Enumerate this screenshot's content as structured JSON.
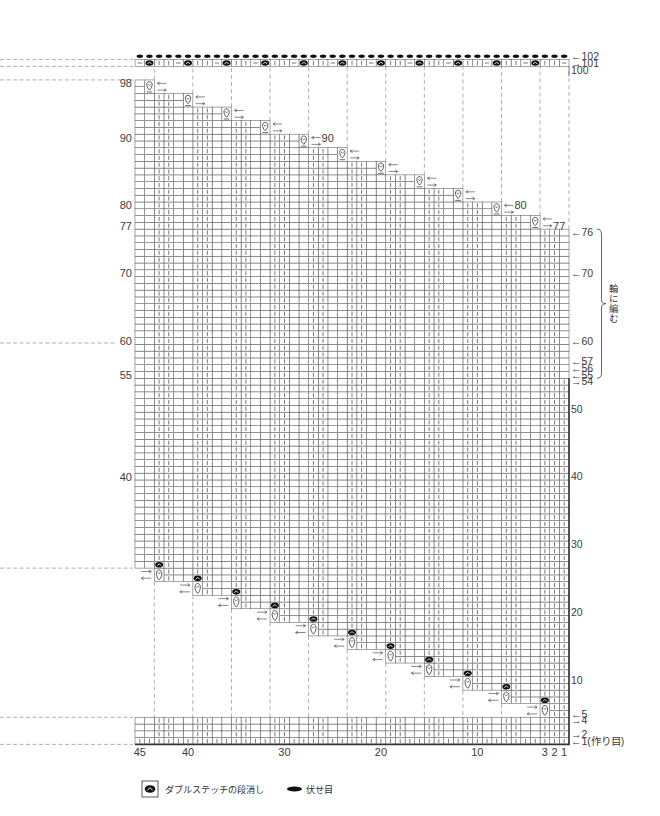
{
  "chart": {
    "total_stitches": 45,
    "total_rows": 102,
    "step_stitches": 4,
    "step_rows": 2,
    "full_rows_bottom": 4,
    "short_rows_bottom_first_row": 5,
    "short_rows_top_last_row": 76,
    "closing_row": 101,
    "bind_off_row": 102,
    "flat_edge_until_row": 54,
    "knit_columns_mod4": [
      2,
      3
    ],
    "closing_row_repeat": [
      "double-stitch-close",
      "purl",
      "knit",
      "knit"
    ]
  },
  "column_labels": [
    {
      "col": 45,
      "text": "45"
    },
    {
      "col": 40,
      "text": "40"
    },
    {
      "col": 30,
      "text": "30"
    },
    {
      "col": 20,
      "text": "20"
    },
    {
      "col": 10,
      "text": "10"
    },
    {
      "col": 3,
      "text": "3"
    },
    {
      "col": 2,
      "text": "2"
    },
    {
      "col": 1,
      "text": "1"
    }
  ],
  "left_row_labels": [
    {
      "row": 98,
      "text": "98"
    },
    {
      "row": 90,
      "text": "90"
    },
    {
      "row": 80,
      "text": "80"
    },
    {
      "row": 77,
      "text": "77"
    },
    {
      "row": 70,
      "text": "70"
    },
    {
      "row": 60,
      "text": "60"
    },
    {
      "row": 55,
      "text": "55"
    },
    {
      "row": 40,
      "text": "40"
    }
  ],
  "right_row_labels": [
    {
      "row": 102,
      "arrow": "←",
      "text": "102"
    },
    {
      "row": 101,
      "arrow": "→",
      "text": "101"
    },
    {
      "row": 100,
      "arrow": "",
      "text": "100"
    },
    {
      "row": 76,
      "arrow": "←",
      "text": "76"
    },
    {
      "row": 70,
      "arrow": "←",
      "text": "70"
    },
    {
      "row": 60,
      "arrow": "←",
      "text": "60"
    },
    {
      "row": 57,
      "arrow": "←",
      "text": "57"
    },
    {
      "row": 56,
      "arrow": "←",
      "text": "56"
    },
    {
      "row": 55,
      "arrow": "←",
      "text": "55"
    },
    {
      "row": 54,
      "arrow": "→",
      "text": "54"
    },
    {
      "row": 50,
      "arrow": "",
      "text": "50"
    },
    {
      "row": 40,
      "arrow": "",
      "text": "40"
    },
    {
      "row": 30,
      "arrow": "",
      "text": "30"
    },
    {
      "row": 20,
      "arrow": "",
      "text": "20"
    },
    {
      "row": 10,
      "arrow": "",
      "text": "10"
    },
    {
      "row": 5,
      "arrow": "←",
      "text": "5"
    },
    {
      "row": 4,
      "arrow": "→",
      "text": "4"
    },
    {
      "row": 2,
      "arrow": "→",
      "text": "2"
    },
    {
      "row": 1,
      "arrow": "←",
      "text": "1(作り目)"
    }
  ],
  "inner_row_labels": [
    {
      "row": 77,
      "text": "77"
    },
    {
      "row": 80,
      "text": "80"
    },
    {
      "row": 90,
      "text": "90"
    }
  ],
  "round_section": {
    "label": "輪に編む",
    "from_row": 55,
    "to_row": 76
  },
  "legend": [
    {
      "icon": "double-stitch-close-icon",
      "label": "ダブルステッチの段消し"
    },
    {
      "icon": "bind-off-icon",
      "label": "伏せ目"
    }
  ]
}
